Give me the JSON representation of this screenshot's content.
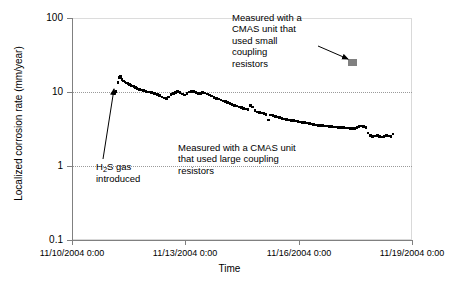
{
  "chart_data": {
    "type": "scatter",
    "title": "",
    "xlabel": "Time",
    "ylabel": "Localized corrosion rate (mm/year)",
    "yscale": "log",
    "ylim": [
      0.1,
      100
    ],
    "ytick_labels": [
      "100",
      "10",
      "1",
      "0.1"
    ],
    "ytick_values": [
      100,
      10,
      1,
      0.1
    ],
    "xtick_labels": [
      "11/10/2004 0:00",
      "11/13/2004 0:00",
      "11/16/2004 0:00",
      "11/19/2004 0:00"
    ],
    "xtick_values": [
      0,
      3,
      6,
      9
    ],
    "xlim_days": [
      0,
      9
    ],
    "grid": "horizontal dotted at 10 and 1, light solid at 100",
    "legend": "none",
    "series": [
      {
        "name": "Measured with a CMAS unit that used large coupling resistors",
        "color": "#000000",
        "marker": "small filled square",
        "points_xy_days_value": [
          [
            1.12,
            9.9
          ],
          [
            1.16,
            10.2
          ],
          [
            1.22,
            13.5
          ],
          [
            1.25,
            15.8
          ],
          [
            1.28,
            16.2
          ],
          [
            1.32,
            14.8
          ],
          [
            1.36,
            14.0
          ],
          [
            1.4,
            13.6
          ],
          [
            1.44,
            13.2
          ],
          [
            1.48,
            13.0
          ],
          [
            1.52,
            12.6
          ],
          [
            1.56,
            12.3
          ],
          [
            1.6,
            12.0
          ],
          [
            1.64,
            11.8
          ],
          [
            1.68,
            11.5
          ],
          [
            1.72,
            11.2
          ],
          [
            1.78,
            10.9
          ],
          [
            1.84,
            10.6
          ],
          [
            1.9,
            10.4
          ],
          [
            1.96,
            10.2
          ],
          [
            2.02,
            10.0
          ],
          [
            2.1,
            9.8
          ],
          [
            2.18,
            9.6
          ],
          [
            2.26,
            9.3
          ],
          [
            2.32,
            9.0
          ],
          [
            2.38,
            8.6
          ],
          [
            2.44,
            8.3
          ],
          [
            2.5,
            8.1
          ],
          [
            2.56,
            8.6
          ],
          [
            2.62,
            9.2
          ],
          [
            2.68,
            9.6
          ],
          [
            2.74,
            9.9
          ],
          [
            2.8,
            10.1
          ],
          [
            2.86,
            9.8
          ],
          [
            2.92,
            9.4
          ],
          [
            2.98,
            9.1
          ],
          [
            3.04,
            9.6
          ],
          [
            3.1,
            10.0
          ],
          [
            3.16,
            10.2
          ],
          [
            3.22,
            10.1
          ],
          [
            3.28,
            9.8
          ],
          [
            3.34,
            9.5
          ],
          [
            3.4,
            9.6
          ],
          [
            3.46,
            9.8
          ],
          [
            3.52,
            9.7
          ],
          [
            3.58,
            9.4
          ],
          [
            3.64,
            9.1
          ],
          [
            3.7,
            8.8
          ],
          [
            3.76,
            8.5
          ],
          [
            3.82,
            8.2
          ],
          [
            3.88,
            8.0
          ],
          [
            3.94,
            7.8
          ],
          [
            4.0,
            7.6
          ],
          [
            4.06,
            7.4
          ],
          [
            4.12,
            7.2
          ],
          [
            4.18,
            7.0
          ],
          [
            4.24,
            6.8
          ],
          [
            4.3,
            6.6
          ],
          [
            4.36,
            6.5
          ],
          [
            4.42,
            6.3
          ],
          [
            4.48,
            6.2
          ],
          [
            4.54,
            6.0
          ],
          [
            4.6,
            5.9
          ],
          [
            4.66,
            5.8
          ],
          [
            4.72,
            6.6
          ],
          [
            4.78,
            6.3
          ],
          [
            4.84,
            5.6
          ],
          [
            4.9,
            5.4
          ],
          [
            4.96,
            5.3
          ],
          [
            5.02,
            5.2
          ],
          [
            5.08,
            5.1
          ],
          [
            5.14,
            5.0
          ],
          [
            5.2,
            4.2
          ],
          [
            5.26,
            4.9
          ],
          [
            5.32,
            4.8
          ],
          [
            5.38,
            4.7
          ],
          [
            5.44,
            4.6
          ],
          [
            5.5,
            4.5
          ],
          [
            5.56,
            4.4
          ],
          [
            5.62,
            4.3
          ],
          [
            5.68,
            4.25
          ],
          [
            5.74,
            4.2
          ],
          [
            5.8,
            4.15
          ],
          [
            5.86,
            4.1
          ],
          [
            5.92,
            4.05
          ],
          [
            5.98,
            4.0
          ],
          [
            6.04,
            3.95
          ],
          [
            6.1,
            3.9
          ],
          [
            6.16,
            3.85
          ],
          [
            6.22,
            3.8
          ],
          [
            6.28,
            3.75
          ],
          [
            6.34,
            3.7
          ],
          [
            6.4,
            3.65
          ],
          [
            6.46,
            3.6
          ],
          [
            6.52,
            3.55
          ],
          [
            6.58,
            3.5
          ],
          [
            6.64,
            3.5
          ],
          [
            6.7,
            3.45
          ],
          [
            6.76,
            3.45
          ],
          [
            6.82,
            3.4
          ],
          [
            6.88,
            3.4
          ],
          [
            6.94,
            3.35
          ],
          [
            7.0,
            3.35
          ],
          [
            7.06,
            3.3
          ],
          [
            7.12,
            3.3
          ],
          [
            7.18,
            3.3
          ],
          [
            7.24,
            3.25
          ],
          [
            7.3,
            3.25
          ],
          [
            7.36,
            3.2
          ],
          [
            7.42,
            3.2
          ],
          [
            7.48,
            3.2
          ],
          [
            7.54,
            3.3
          ],
          [
            7.6,
            3.4
          ],
          [
            7.66,
            3.45
          ],
          [
            7.72,
            3.4
          ],
          [
            7.78,
            3.3
          ],
          [
            7.84,
            2.8
          ],
          [
            7.9,
            2.6
          ],
          [
            7.96,
            2.5
          ],
          [
            8.02,
            2.55
          ],
          [
            8.08,
            2.6
          ],
          [
            8.14,
            2.5
          ],
          [
            8.2,
            2.45
          ],
          [
            8.26,
            2.5
          ],
          [
            8.32,
            2.6
          ],
          [
            8.38,
            2.55
          ],
          [
            8.44,
            2.5
          ],
          [
            8.5,
            2.7
          ]
        ]
      },
      {
        "name": "Measured with a CMAS unit that used small coupling resistors",
        "color": "#808080",
        "marker": "filled rectangle",
        "points_xy_days_value": [
          [
            7.42,
            25.0
          ]
        ]
      }
    ],
    "annotations": [
      {
        "id": "small-resistor-note",
        "text": "Measured with a CMAS unit that used small coupling resistors",
        "lines": [
          "Measured with a",
          "CMAS unit that",
          "used small",
          "coupling",
          "resistors"
        ],
        "arrow": "points right toward gray marker"
      },
      {
        "id": "large-resistor-note",
        "text": "Measured with a CMAS unit that used large coupling resistors",
        "lines": [
          "Measured with a CMAS unit",
          "that used large coupling",
          "resistors"
        ],
        "arrow": "none"
      },
      {
        "id": "h2s-note",
        "text": "H2S gas introduced",
        "lines": [
          "H₂S gas",
          "introduced"
        ],
        "arrow": "points up-right toward first data points"
      }
    ]
  },
  "axes": {
    "y_labels": [
      "100",
      "10",
      "1",
      "0.1"
    ],
    "x_labels": [
      "11/10/2004 0:00",
      "11/13/2004 0:00",
      "11/16/2004 0:00",
      "11/19/2004 0:00"
    ],
    "x_title": "Time",
    "y_title": "Localized corrosion rate (mm/year)"
  },
  "annotations": {
    "small_resistors": {
      "line1": "Measured with a",
      "line2": "CMAS unit that",
      "line3": "used small",
      "line4": "coupling",
      "line5": "resistors"
    },
    "large_resistors": {
      "line1": "Measured with a CMAS unit",
      "line2": "that used large coupling",
      "line3": "resistors"
    },
    "h2s": {
      "line1_prefix": "H",
      "line1_sub": "2",
      "line1_suffix": "S gas",
      "line2": "introduced"
    }
  },
  "colors": {
    "data_large": "#000000",
    "data_small": "#808080",
    "axis": "#808080",
    "grid": "#9a9a9a",
    "frame": "#d9d9d9"
  }
}
